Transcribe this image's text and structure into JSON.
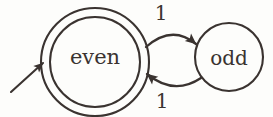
{
  "diagram": {
    "ink_color": "#3a3330",
    "background_color": "#fdfdfb",
    "states": [
      {
        "id": "even",
        "label": "even",
        "shape": "double-circle",
        "accepting": true,
        "start": true,
        "cx": 95,
        "cy": 62,
        "r_outer": 54,
        "r_inner": 45
      },
      {
        "id": "odd",
        "label": "odd",
        "shape": "circle",
        "accepting": false,
        "start": false,
        "cx": 229,
        "cy": 57,
        "r_outer": 34
      }
    ],
    "transitions": [
      {
        "id": "even-to-odd",
        "from": "even",
        "to": "odd",
        "label": "1",
        "curve": "arc-above",
        "label_position": "top"
      },
      {
        "id": "odd-to-even",
        "from": "odd",
        "to": "even",
        "label": "1",
        "curve": "arc-below",
        "label_position": "bottom"
      }
    ],
    "start_arrow": {
      "id": "start-arrow",
      "target": "even",
      "direction": "from-lower-left"
    }
  }
}
